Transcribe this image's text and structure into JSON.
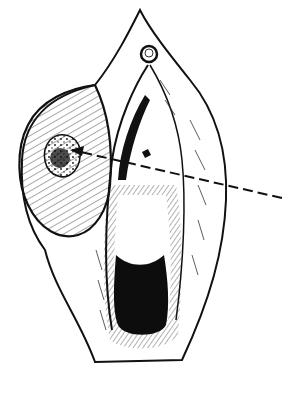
{
  "figure": {
    "type": "line-art illustration",
    "style": "black ink on white",
    "colors": {
      "ink": "#111111",
      "background": "#ffffff"
    },
    "elements": [
      {
        "name": "lesion",
        "position": "left"
      },
      {
        "name": "pointer-line",
        "style": "dashed",
        "direction": "from right edge to lesion"
      },
      {
        "name": "small-circular-structure",
        "position": "top center"
      },
      {
        "name": "dark-opening",
        "position": "lower center"
      }
    ]
  }
}
